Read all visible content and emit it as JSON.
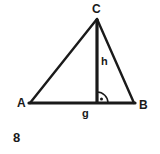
{
  "figure": {
    "kind": "triangle-with-altitude",
    "background_color": "#ffffff",
    "stroke_color": "#1a1a1a",
    "figure_number": "8",
    "vertices": {
      "A": {
        "label": "A",
        "x": 30,
        "y": 103
      },
      "B": {
        "label": "B",
        "x": 134,
        "y": 103
      },
      "C": {
        "label": "C",
        "x": 97,
        "y": 19
      }
    },
    "altitude": {
      "label": "h",
      "from_x": 97,
      "from_y": 19,
      "to_x": 97,
      "to_y": 103,
      "stroke_width": 3
    },
    "base": {
      "label": "g",
      "from_x": 30,
      "from_y": 103,
      "to_x": 134,
      "to_y": 103,
      "stroke_width": 3
    },
    "sides": [
      {
        "name": "side-AC",
        "x1": 30,
        "y1": 103,
        "x2": 97,
        "y2": 19,
        "stroke_width": 2.4
      },
      {
        "name": "side-CB",
        "x1": 97,
        "y1": 19,
        "x2": 134,
        "y2": 103,
        "stroke_width": 2.4
      }
    ],
    "right_angle_mark": {
      "name": "right-angle-arc",
      "vertex_x": 97,
      "vertex_y": 103,
      "radius": 11,
      "dot_x": 101,
      "dot_y": 99,
      "dot_radius": 1.4,
      "stroke_width": 1.4
    }
  }
}
